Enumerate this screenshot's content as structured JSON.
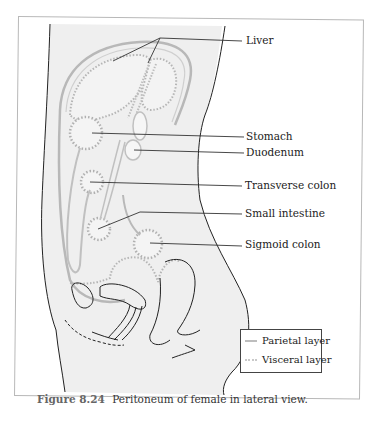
{
  "figure": {
    "number": "Figure 8.24",
    "caption": "Peritoneum of female in lateral view."
  },
  "labels": [
    {
      "id": "liver",
      "text": "Liver"
    },
    {
      "id": "stomach",
      "text": "Stomach"
    },
    {
      "id": "duodenum",
      "text": "Duodenum"
    },
    {
      "id": "transverse-colon",
      "text": "Transverse colon"
    },
    {
      "id": "small-intestine",
      "text": "Small intestine"
    },
    {
      "id": "sigmoid-colon",
      "text": "Sigmoid colon"
    }
  ],
  "legend": {
    "items": [
      {
        "label": "Parietal layer",
        "style": "solid",
        "color": "#bdbdbd"
      },
      {
        "label": "Visceral layer",
        "style": "dotted",
        "color": "#c9c9c9"
      }
    ]
  },
  "colors": {
    "body_fill": "#efefef",
    "outline": "#222222",
    "membrane": "#b5b5b5",
    "leader": "#333333"
  }
}
